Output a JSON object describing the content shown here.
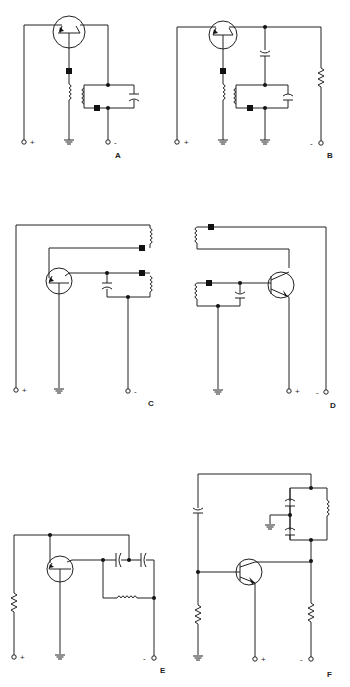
{
  "figure": {
    "circuits": [
      {
        "id": "A",
        "label": "A",
        "terminals": {
          "positive": "+",
          "negative": "-"
        }
      },
      {
        "id": "B",
        "label": "B",
        "terminals": {
          "positive": "+",
          "negative": "-"
        }
      },
      {
        "id": "C",
        "label": "C",
        "terminals": {
          "positive": "+",
          "negative": "-"
        }
      },
      {
        "id": "D",
        "label": "D",
        "terminals": {
          "positive": "+",
          "negative": "-"
        }
      },
      {
        "id": "E",
        "label": "E",
        "terminals": {
          "positive": "+",
          "negative": "-"
        }
      },
      {
        "id": "F",
        "label": "F",
        "terminals": {
          "positive": "+",
          "negative": "-"
        }
      }
    ]
  }
}
